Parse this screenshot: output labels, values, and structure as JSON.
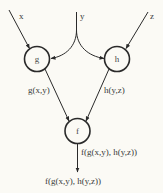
{
  "diagram": {
    "inputs": {
      "x": "x",
      "y": "y",
      "z": "z"
    },
    "nodes": {
      "g": "g",
      "h": "h",
      "f": "f"
    },
    "edge_labels": {
      "g_out": "g(x,y)",
      "h_out": "h(y,z)",
      "f_out": "f(g(x,y), h(y,z))"
    },
    "output_label": "f(g(x,y), h(y,z))",
    "colors": {
      "background": "#fbfaf5",
      "stroke": "#2a2a2a",
      "text": "#3a3a3a"
    }
  }
}
